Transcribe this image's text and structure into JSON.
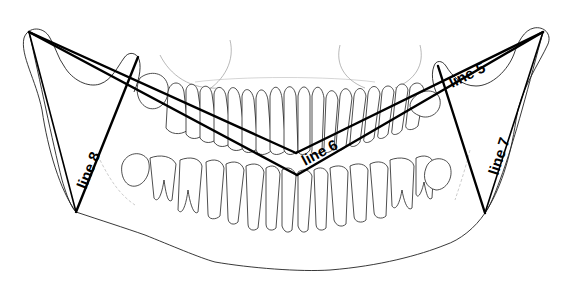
{
  "figure": {
    "colors": {
      "background": "#ffffff",
      "drawing": "#222222",
      "measurement_lines": "#000000"
    }
  },
  "labels": {
    "line5": "line 5",
    "line6": "line 6",
    "line7": "line 7",
    "line8": "line 8"
  },
  "points": {
    "left_condyle": [
      29,
      32
    ],
    "right_condyle": [
      543,
      32
    ],
    "upper_vertex": [
      296,
      153
    ],
    "lower_vertex": [
      297,
      175
    ],
    "left_coronoid": [
      138,
      57
    ],
    "left_gonion": [
      76,
      212
    ],
    "right_coronoid": [
      438,
      66
    ],
    "right_gonion": [
      485,
      213
    ]
  }
}
